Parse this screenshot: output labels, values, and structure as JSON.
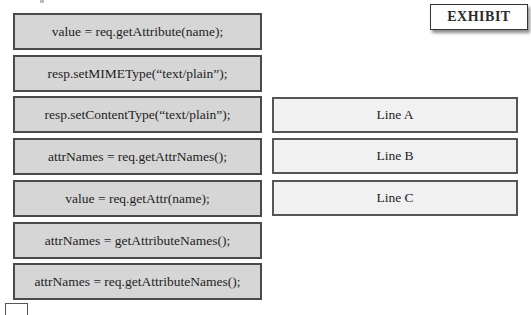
{
  "exhibit_button": {
    "label": "EXHIBIT"
  },
  "source_items": [
    {
      "label": "value = req.getAttribute(name);"
    },
    {
      "label": "resp.setMIMEType(“text/plain”);"
    },
    {
      "label": "resp.setContentType(“text/plain”);"
    },
    {
      "label": "attrNames = req.getAttrNames();"
    },
    {
      "label": "value = req.getAttr(name);"
    },
    {
      "label": "attrNames = getAttributeNames();"
    },
    {
      "label": "attrNames = req.getAttributeNames();"
    }
  ],
  "targets": [
    {
      "label": "Line A"
    },
    {
      "label": "Line B"
    },
    {
      "label": "Line C"
    }
  ],
  "colors": {
    "source_fill": "#d6d6d6",
    "target_fill": "#f1f1f1",
    "border": "#4a4a4a"
  }
}
